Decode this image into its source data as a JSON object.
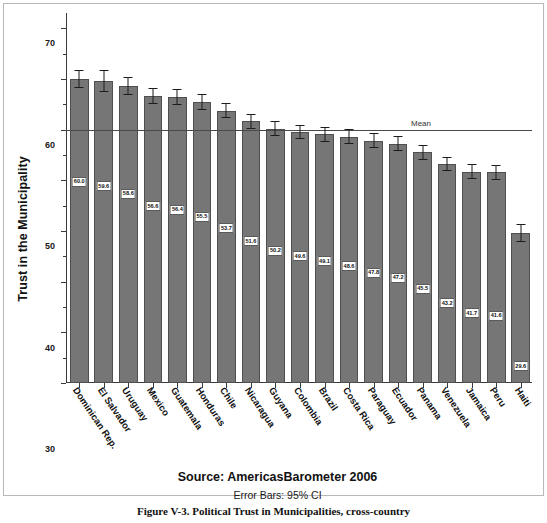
{
  "chart_data": {
    "type": "bar",
    "title": "",
    "xlabel": "",
    "ylabel": "Trust in the Municipality",
    "ylim": [
      0,
      73
    ],
    "yticks": [
      0,
      10,
      20,
      30,
      40,
      50,
      60,
      70
    ],
    "ytick_labels": [
      "0",
      "10",
      "20",
      "30",
      "40",
      "50",
      "60",
      "70"
    ],
    "grid": false,
    "legend": "none",
    "mean_line": {
      "value": 50,
      "label": "Mean"
    },
    "error_bars": "95% CI",
    "categories": [
      "Dominican Rep.",
      "El Salvador",
      "Uruguay",
      "Mexico",
      "Guatemala",
      "Honduras",
      "Chile",
      "Nicaragua",
      "Guyana",
      "Colombia",
      "Brazil",
      "Costa Rica",
      "Paraguay",
      "Ecuador",
      "Panama",
      "Venezuela",
      "Jamaica",
      "Peru",
      "Haiti"
    ],
    "values": [
      60.0,
      59.6,
      58.6,
      56.6,
      56.4,
      55.5,
      53.7,
      51.6,
      50.2,
      49.6,
      49.1,
      48.6,
      47.8,
      47.2,
      45.5,
      43.2,
      41.7,
      41.6,
      29.6
    ],
    "value_labels": [
      "60.0",
      "59.6",
      "58.6",
      "56.6",
      "56.4",
      "55.5",
      "53.7",
      "51.6",
      "50.2",
      "49.6",
      "49.1",
      "48.6",
      "47.8",
      "47.2",
      "45.5",
      "43.2",
      "41.7",
      "41.6",
      "29.6"
    ],
    "ci_low": [
      58.2,
      57.4,
      56.8,
      55.0,
      54.8,
      53.9,
      52.2,
      50.1,
      48.8,
      48.2,
      47.6,
      47.1,
      46.3,
      45.7,
      44.0,
      41.8,
      40.2,
      40.1,
      27.8
    ],
    "ci_high": [
      61.8,
      61.8,
      60.4,
      58.2,
      58.0,
      57.1,
      55.2,
      53.1,
      51.6,
      51.0,
      50.6,
      50.1,
      49.3,
      48.7,
      47.0,
      44.6,
      43.2,
      43.1,
      31.4
    ],
    "bar_color": "#767676",
    "bar_edge_color": "#4f4f4f",
    "axis_color": "#3a3a3a",
    "mean_line_color": "#4a4a4a"
  },
  "footer": {
    "source": "Source: AmericasBarometer 2006",
    "error_bars": "Error Bars: 95% CI"
  },
  "caption": "Figure V-3. Political Trust in Municipalities, cross-country"
}
